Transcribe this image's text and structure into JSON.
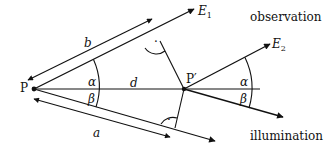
{
  "diagram": {
    "labels": {
      "P": "P",
      "P_prime": "P′",
      "E1": "E",
      "E1_sub": "1",
      "E2": "E",
      "E2_sub": "2",
      "observation": "observation",
      "illumination": "illumination",
      "b": "b",
      "a": "a",
      "d": "d",
      "alpha_left": "α",
      "beta_left": "β",
      "alpha_right": "α",
      "beta_right": "β",
      "right_angle_dot_top": "·",
      "right_angle_dot_bottom": "·"
    },
    "colors": {
      "line": "#111111",
      "background": "#ffffff"
    }
  }
}
